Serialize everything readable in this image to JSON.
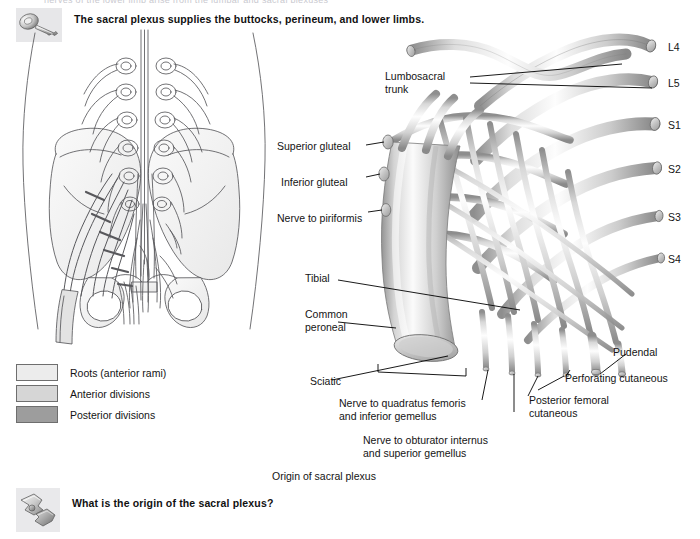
{
  "page": {
    "cutoff_top_text": "nerves of the lower limb arise from the lumbar and sacral plexuses",
    "caption": "Origin of sacral plexus"
  },
  "key_banner": {
    "icon": "key-icon",
    "text": "The sacral plexus supplies the buttocks, perineum, and lower limbs."
  },
  "question_banner": {
    "icon": "puzzle-pieces-icon",
    "text": "What is the origin of the sacral plexus?"
  },
  "legend": {
    "items": [
      {
        "label": "Roots (anterior rami)",
        "color": "#ececec"
      },
      {
        "label": "Anterior divisions",
        "color": "#d6d6d6"
      },
      {
        "label": "Posterior divisions",
        "color": "#9d9d9d"
      }
    ]
  },
  "spinal_levels": [
    {
      "label": "L4"
    },
    {
      "label": "L5"
    },
    {
      "label": "S1"
    },
    {
      "label": "S2"
    },
    {
      "label": "S3"
    },
    {
      "label": "S4"
    }
  ],
  "nerve_labels": {
    "lumbosacral_trunk": "Lumbosacral\ntrunk",
    "superior_gluteal": "Superior gluteal",
    "inferior_gluteal": "Inferior gluteal",
    "nerve_to_piriformis": "Nerve to piriformis",
    "tibial": "Tibial",
    "common_peroneal": "Common\nperoneal",
    "sciatic": "Sciatic",
    "quadratus_femoris": "Nerve to quadratus femoris\nand inferior gemellus",
    "obturator_internus": "Nerve to obturator internus\nand superior gemellus",
    "posterior_femoral_cutaneous": "Posterior femoral\ncutaneous",
    "perforating_cutaneous": "Perforating cutaneous",
    "pudendal": "Pudendal"
  },
  "colors": {
    "background": "#ffffff",
    "text": "#141414",
    "line": "#000000",
    "nerve_light": "#f2f2f2",
    "nerve_mid": "#cfcfcf",
    "nerve_dark": "#9a9a9a",
    "bone_fill": "#f2f2f2",
    "outline": "#4a4a4a"
  }
}
